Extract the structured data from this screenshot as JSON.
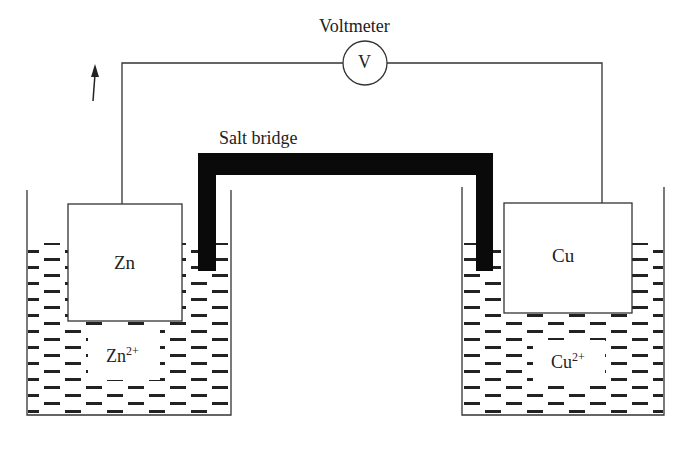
{
  "diagram": {
    "type": "galvanic-cell",
    "labels": {
      "voltmeter": "Voltmeter",
      "voltmeter_symbol": "V",
      "salt_bridge": "Salt bridge",
      "anode": "Zn",
      "cathode": "Cu",
      "anode_ion_base": "Zn",
      "anode_ion_charge": "2+",
      "cathode_ion_base": "Cu",
      "cathode_ion_charge": "2+"
    },
    "colors": {
      "line": "#333333",
      "salt_bridge": "#0a0a0a",
      "dash": "#222222",
      "background": "#ffffff"
    }
  }
}
